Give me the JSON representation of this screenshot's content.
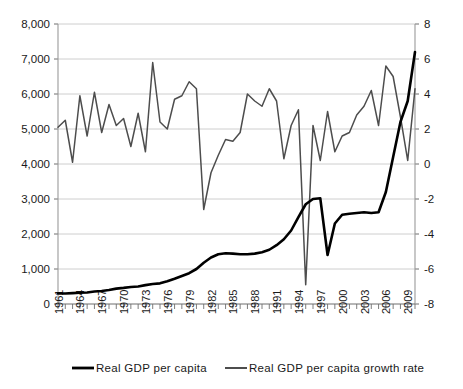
{
  "chart_data": {
    "type": "line",
    "title": "",
    "xlabel": "",
    "ylabel": "",
    "y2label": "",
    "grid": true,
    "legend_position": "bottom",
    "x": [
      1961,
      1962,
      1963,
      1964,
      1965,
      1966,
      1967,
      1968,
      1969,
      1970,
      1971,
      1972,
      1973,
      1974,
      1975,
      1976,
      1977,
      1978,
      1979,
      1980,
      1981,
      1982,
      1983,
      1984,
      1985,
      1986,
      1987,
      1988,
      1989,
      1990,
      1991,
      1992,
      1993,
      1994,
      1995,
      1996,
      1997,
      1998,
      1999,
      2000,
      2001,
      2002,
      2003,
      2004,
      2005,
      2006,
      2007,
      2008,
      2009,
      2010
    ],
    "xtick_labels": [
      "1961",
      "1964",
      "1967",
      "1970",
      "1973",
      "1976",
      "1979",
      "1982",
      "1985",
      "1988",
      "1991",
      "1994",
      "1997",
      "2000",
      "2003",
      "2006",
      "2009"
    ],
    "xtick_step_years": 3,
    "ylim": [
      0,
      8000
    ],
    "yticks": [
      "0",
      "1,000",
      "2,000",
      "3,000",
      "4,000",
      "5,000",
      "6,000",
      "7,000",
      "8,000"
    ],
    "y2lim": [
      -8,
      8
    ],
    "y2ticks": [
      "-8",
      "-6",
      "-4",
      "-2",
      "0",
      "2",
      "4",
      "6",
      "8"
    ],
    "series": [
      {
        "name": "Real GDP per capita",
        "axis": "left",
        "color": "#000000",
        "width": 2.6,
        "values": [
          300,
          300,
          310,
          320,
          330,
          355,
          370,
          400,
          440,
          460,
          485,
          500,
          540,
          570,
          590,
          650,
          720,
          800,
          880,
          1000,
          1180,
          1330,
          1420,
          1450,
          1440,
          1420,
          1420,
          1440,
          1480,
          1550,
          1680,
          1850,
          2100,
          2480,
          2850,
          3000,
          3020,
          1400,
          2300,
          2550,
          2580,
          2600,
          2620,
          2600,
          2620,
          3200,
          4200,
          5200,
          5800,
          7200
        ]
      },
      {
        "name": "Real GDP per capita growth rate",
        "axis": "right",
        "color": "#4d4d4d",
        "width": 1.5,
        "values": [
          2.1,
          2.5,
          0.1,
          3.9,
          1.6,
          4.1,
          1.8,
          3.4,
          2.2,
          2.6,
          1.0,
          2.9,
          0.7,
          5.8,
          2.4,
          2.0,
          3.7,
          3.9,
          4.7,
          4.3,
          -2.6,
          -0.5,
          0.5,
          1.4,
          1.3,
          1.8,
          4.0,
          3.6,
          3.3,
          4.3,
          3.6,
          0.3,
          2.2,
          3.1,
          -6.9,
          2.2,
          0.2,
          3.0,
          0.7,
          1.6,
          1.8,
          2.8,
          3.3,
          4.2,
          2.2,
          5.6,
          5.0,
          2.7,
          0.2,
          4.3
        ]
      }
    ]
  },
  "legend": {
    "items": [
      {
        "label": "Real GDP per capita",
        "color": "#000000"
      },
      {
        "label": "Real GDP per capita growth rate",
        "color": "#4d4d4d"
      }
    ]
  },
  "ghost_title": ""
}
